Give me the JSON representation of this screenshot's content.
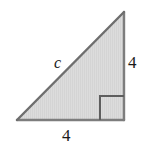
{
  "figure": {
    "kind": "right-triangle-diagram",
    "background_color": "#ffffff",
    "fill_color": "#d9d9d9",
    "stroke_color": "#7d7d7d",
    "hypotenuse_stroke_color": "#6e6e6e",
    "marker_stroke_color": "#5e5e5e",
    "label_color": "#1a1a1a",
    "stroke_width": 2,
    "vertices": {
      "bottom_left": [
        17,
        120
      ],
      "bottom_right": [
        124,
        120
      ],
      "top_right": [
        124,
        12
      ]
    },
    "right_angle_marker": {
      "corner": "bottom-right",
      "size": 24,
      "x": 100,
      "y": 96
    },
    "labels": {
      "hypotenuse": "c",
      "vertical_leg": "4",
      "horizontal_leg": "4"
    }
  },
  "chart_data": {
    "type": "diagram",
    "title": "",
    "shape": "right triangle",
    "sides": [
      {
        "name": "hypotenuse",
        "label": "c",
        "position": "upper-left edge",
        "value": null
      },
      {
        "name": "vertical leg",
        "label": "4",
        "position": "right edge",
        "value": 4
      },
      {
        "name": "horizontal leg",
        "label": "4",
        "position": "bottom edge",
        "value": 4
      }
    ],
    "angles": [
      {
        "vertex": "bottom-right",
        "measure": 90,
        "marked": true
      }
    ]
  }
}
